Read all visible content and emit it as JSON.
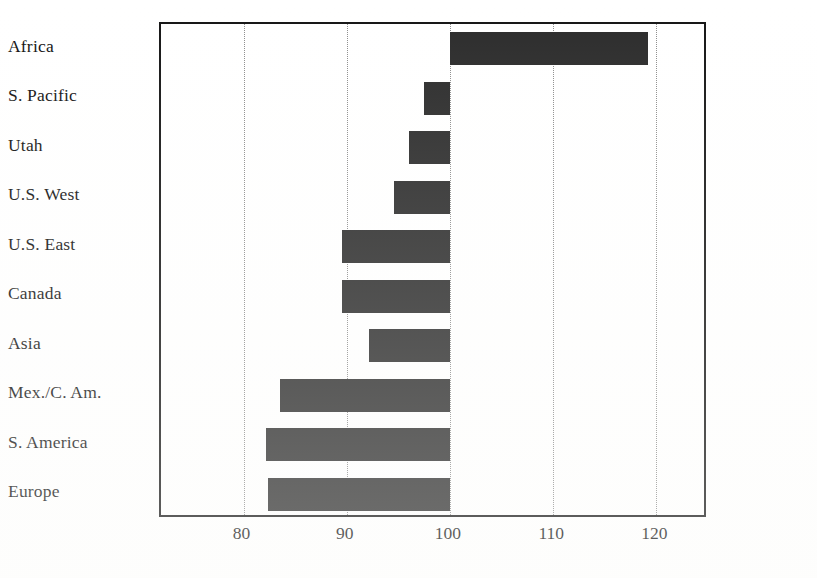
{
  "chart_data": {
    "type": "bar",
    "orientation": "horizontal",
    "title": "",
    "subtitle": "",
    "xlabel": "",
    "ylabel": "",
    "categories": [
      "Africa",
      "S. Pacific",
      "Utah",
      "U.S. West",
      "U.S. East",
      "Canada",
      "Asia",
      "Mex./C. Am.",
      "S. America",
      "Europe"
    ],
    "values": [
      119.2,
      97.5,
      96.0,
      94.6,
      89.5,
      89.5,
      92.2,
      83.5,
      82.2,
      82.4
    ],
    "baseline": 100,
    "xlim": [
      72,
      125
    ],
    "xticks": [
      80,
      90,
      100,
      110,
      120
    ],
    "xtick_labels": [
      "80",
      "90",
      "100",
      "110",
      "120"
    ],
    "grid": true,
    "grid_style": "dotted",
    "legend": null,
    "bar_color": "#2b2b2b",
    "grid_color": "#8d8d8d",
    "frame_color": "#151515",
    "background_color": "#ffffff"
  }
}
